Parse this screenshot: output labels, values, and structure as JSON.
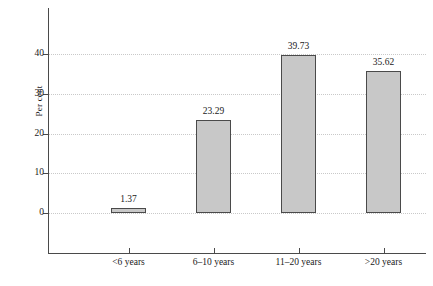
{
  "chart_data": {
    "type": "bar",
    "title": "",
    "subtitle": "",
    "xlabel": "",
    "ylabel": "Per cent",
    "categories": [
      "<6 years",
      "6–10 years",
      "11–20 years",
      ">20 years"
    ],
    "values": [
      1.37,
      23.29,
      39.73,
      35.62
    ],
    "value_labels": [
      "1.37",
      "23.29",
      "39.73",
      "35.62"
    ],
    "ylim": [
      0,
      40
    ],
    "y_ticks": [
      0,
      10,
      20,
      30,
      40
    ],
    "y_tick_labels": [
      "0",
      "10",
      "20",
      "30",
      "40"
    ],
    "grid": "horizontal-dotted",
    "legend": "none",
    "bar_fill": "#c8c8c8",
    "bar_border": "#4a4a4a",
    "axis_color": "#4a4a4a",
    "grid_color": "#c9c9c9",
    "background": "#ffffff"
  }
}
